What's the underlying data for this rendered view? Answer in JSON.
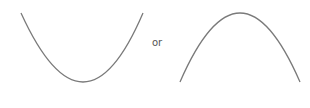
{
  "diagram": {
    "connector_text": "or",
    "stroke_color": "#7a7a7a",
    "curves": [
      {
        "name": "upward-parabola",
        "shape": "U",
        "start": [
          21,
          13
        ],
        "vertex": [
          84,
          82
        ],
        "end": [
          143,
          13
        ]
      },
      {
        "name": "downward-parabola",
        "shape": "n",
        "start": [
          180,
          82
        ],
        "vertex": [
          240,
          13
        ],
        "end": [
          300,
          82
        ]
      }
    ]
  }
}
